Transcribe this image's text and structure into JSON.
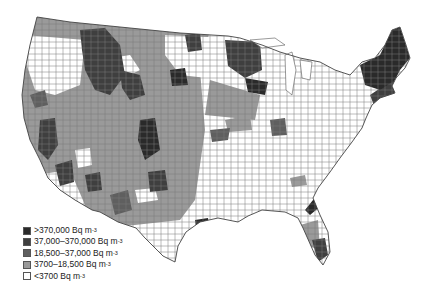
{
  "map": {
    "subject": "Indoor radon concentration by US county",
    "region": "Contiguous United States",
    "colors": {
      "background": "#ffffff",
      "county_border": "#777777",
      "outline": "#444444"
    }
  },
  "legend": {
    "unit_suffix": "-3",
    "items": [
      {
        "label": ">370,000 Bq m",
        "exp": "-3",
        "color": "#2a2a2a"
      },
      {
        "label": "37,000–370,000 Bq m",
        "exp": "-3",
        "color": "#3f3f3f"
      },
      {
        "label": "18,500–37,000 Bq m",
        "exp": "-3",
        "color": "#5f5f5f"
      },
      {
        "label": "3700–18,500 Bq m",
        "exp": "-3",
        "color": "#9a9a9a"
      },
      {
        "label": "<3700 Bq m",
        "exp": "-3",
        "color": "#ffffff"
      }
    ]
  }
}
